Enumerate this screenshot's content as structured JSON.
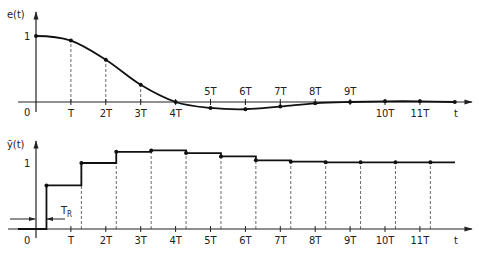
{
  "chart_data": [
    {
      "type": "line",
      "title": "",
      "ylabel": "e(t)",
      "xlabel": "t",
      "y_tick_labels": [
        "0",
        "1"
      ],
      "x_tick_labels": [
        "T",
        "2T",
        "3T",
        "4T",
        "5T",
        "6T",
        "7T",
        "8T",
        "9T",
        "10T",
        "11T"
      ],
      "x": [
        0,
        1,
        2,
        3,
        4,
        5,
        6,
        7,
        8,
        9,
        10,
        11,
        12
      ],
      "values": [
        1.0,
        0.93,
        0.64,
        0.26,
        0.0,
        -0.09,
        -0.11,
        -0.07,
        -0.02,
        0.0,
        0.01,
        0.01,
        0.0
      ],
      "x_unit": "T",
      "sample_markers": true,
      "dashed_drop_lines": true,
      "grid": false,
      "legend": "none"
    },
    {
      "type": "line",
      "step": true,
      "title": "",
      "ylabel": "ȳ(t)",
      "xlabel": "t",
      "y_tick_labels": [
        "0",
        "1"
      ],
      "x_tick_labels": [
        "T",
        "2T",
        "3T",
        "4T",
        "5T",
        "6T",
        "7T",
        "8T",
        "9T",
        "10T",
        "11T"
      ],
      "annotation": "T_R",
      "delay": 0.3,
      "x": [
        0.3,
        1.3,
        2.3,
        3.3,
        4.3,
        5.3,
        6.3,
        7.3,
        8.3,
        9.3,
        10.3,
        11.3
      ],
      "values": [
        0.66,
        1.0,
        1.17,
        1.19,
        1.15,
        1.1,
        1.04,
        1.02,
        1.01,
        1.01,
        1.01,
        1.01
      ],
      "x_unit": "T",
      "sample_markers": true,
      "dashed_drop_lines": true,
      "grid": false,
      "legend": "none"
    }
  ],
  "labels": {
    "top_ylabel": "e(t)",
    "bottom_ylabel": "ȳ(t)",
    "one": "1",
    "zero": "0",
    "t": "t",
    "tr_main": "T",
    "tr_sub": "R",
    "ticks": [
      "T",
      "2T",
      "3T",
      "4T",
      "5T",
      "6T",
      "7T",
      "8T",
      "9T",
      "10T",
      "11T"
    ]
  }
}
